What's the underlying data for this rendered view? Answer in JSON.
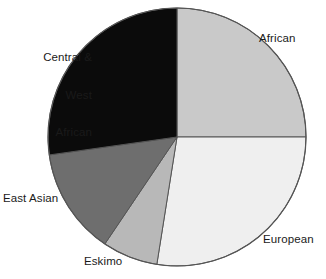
{
  "chart_data": {
    "type": "pie",
    "title": "",
    "subtitle": "",
    "xlabel": "",
    "ylabel": "",
    "grid": false,
    "legend_position": "none",
    "label_placement": "outside-callout",
    "start_angle_deg": 0,
    "direction": "clockwise",
    "categories": [
      "African",
      "European",
      "Eskimo",
      "East Asian",
      "Central & West African"
    ],
    "values": [
      25.0,
      27.5,
      7.0,
      13.3,
      27.2
    ],
    "units": "percent",
    "slices": [
      {
        "label": "African",
        "value": 25.0,
        "start_angle_deg": 0,
        "end_angle_deg": 90,
        "color": "#c9c9c9",
        "label_lines": [
          "African"
        ],
        "label_align": "left"
      },
      {
        "label": "European",
        "value": 27.5,
        "start_angle_deg": 90,
        "end_angle_deg": 189,
        "color": "#efefef",
        "label_lines": [
          "European"
        ],
        "label_align": "left"
      },
      {
        "label": "Eskimo",
        "value": 7.0,
        "start_angle_deg": 189,
        "end_angle_deg": 214,
        "color": "#b8b8b8",
        "label_lines": [
          "Eskimo"
        ],
        "label_align": "left"
      },
      {
        "label": "East Asian",
        "value": 13.3,
        "start_angle_deg": 214,
        "end_angle_deg": 262,
        "color": "#6e6e6e",
        "label_lines": [
          "East Asian"
        ],
        "label_align": "left"
      },
      {
        "label": "Central & West African",
        "value": 27.2,
        "start_angle_deg": 262,
        "end_angle_deg": 360,
        "color": "#0b0b0b",
        "label_lines": [
          "Central &",
          "West",
          "African"
        ],
        "label_align": "right"
      }
    ],
    "geometry": {
      "center_x": 177,
      "center_y": 137,
      "radius": 129,
      "outline_color": "#555555"
    }
  },
  "labels": {
    "african": "African",
    "european": "European",
    "eskimo": "Eskimo",
    "east_asian": "East Asian",
    "central_west_african_line1": "Central &",
    "central_west_african_line2": "West",
    "central_west_african_line3": "African"
  }
}
